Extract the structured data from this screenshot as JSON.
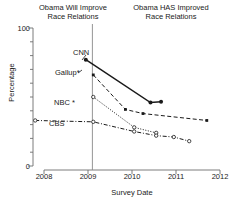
{
  "panels": {
    "left_title": "Obama Will Improve\nRace Relations",
    "right_title": "Obama HAS Improved\nRace Relations"
  },
  "axes": {
    "ylabel": "Percentage",
    "xlabel": "Survey Date",
    "yticks": [
      "0",
      "100"
    ],
    "xticks": [
      "2008",
      "2009",
      "2010",
      "2011",
      "2012"
    ]
  },
  "series_labels": {
    "cnn": "CNN",
    "gallup": "Gallup*",
    "nbc": "NBC *",
    "cbs": "CBS"
  },
  "colors": {
    "axis": "#6e6e6e",
    "line": "#1a1a1a",
    "divider": "#8a8a8a"
  },
  "chart_data": {
    "type": "line",
    "xlabel": "Survey Date",
    "ylabel": "Percentage",
    "xlim": [
      2008,
      2012
    ],
    "ylim": [
      0,
      100
    ],
    "grid": false,
    "legend": "inline-labels",
    "annotations": [
      {
        "text": "Obama Will Improve Race Relations",
        "region": "left-of-divider"
      },
      {
        "text": "Obama HAS Improved Race Relations",
        "region": "right-of-divider"
      },
      {
        "type": "vertical-divider",
        "x": 2009.1
      }
    ],
    "series": [
      {
        "name": "CNN",
        "linestyle": "solid",
        "marker": "filled-circle",
        "points": [
          {
            "x": 2008.95,
            "y": 77
          },
          {
            "x": 2010.42,
            "y": 46
          },
          {
            "x": 2010.66,
            "y": 46.5
          }
        ]
      },
      {
        "name": "Gallup*",
        "linestyle": "dashed",
        "marker": "filled-square",
        "points": [
          {
            "x": 2009.12,
            "y": 66
          },
          {
            "x": 2009.85,
            "y": 41
          },
          {
            "x": 2010.25,
            "y": 38
          },
          {
            "x": 2011.7,
            "y": 33
          }
        ]
      },
      {
        "name": "NBC *",
        "linestyle": "dotted",
        "marker": "open-circle",
        "points": [
          {
            "x": 2009.12,
            "y": 50
          },
          {
            "x": 2010.05,
            "y": 28
          },
          {
            "x": 2010.55,
            "y": 24
          }
        ]
      },
      {
        "name": "CBS",
        "linestyle": "dash-dot",
        "marker": "open-circle",
        "points": [
          {
            "x": 2007.8,
            "y": 33
          },
          {
            "x": 2009.12,
            "y": 32
          },
          {
            "x": 2010.05,
            "y": 25
          },
          {
            "x": 2010.55,
            "y": 22
          },
          {
            "x": 2010.95,
            "y": 21
          },
          {
            "x": 2011.3,
            "y": 18
          }
        ]
      }
    ]
  }
}
